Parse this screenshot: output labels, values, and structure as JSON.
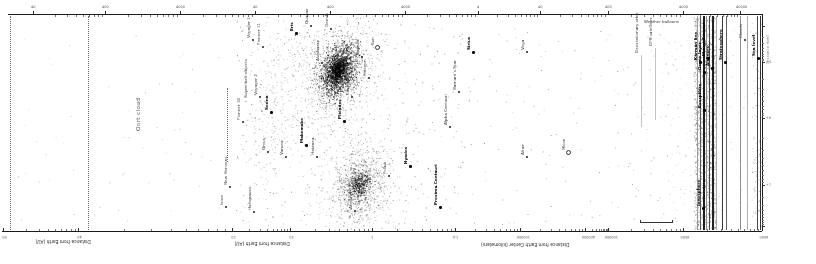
{
  "figure": {
    "background": "#ffffff",
    "ink": "#1a1a1a",
    "top_axis": {
      "y": 14,
      "x1": 8,
      "x2": 762,
      "majors": [
        {
          "x": 33,
          "t": "40"
        },
        {
          "x": 105,
          "t": "400"
        },
        {
          "x": 180,
          "t": "4000"
        },
        {
          "x": 255,
          "t": "40"
        },
        {
          "x": 330,
          "t": "400"
        },
        {
          "x": 405,
          "t": "4000"
        },
        {
          "x": 478,
          "t": "4"
        },
        {
          "x": 540,
          "t": "40"
        },
        {
          "x": 608,
          "t": "400"
        },
        {
          "x": 683,
          "t": "4000"
        },
        {
          "x": 740,
          "t": "40000"
        }
      ]
    },
    "bottom_axis": {
      "y": 231,
      "x1": 2,
      "x2": 762,
      "majors": [
        {
          "x": 3,
          "t": "80"
        },
        {
          "x": 78,
          "t": "40"
        },
        {
          "x": 232,
          "t": "20"
        },
        {
          "x": 290,
          "t": "10"
        },
        {
          "x": 372,
          "t": "1"
        },
        {
          "x": 455,
          "t": "1.6"
        },
        {
          "x": 520,
          "t": "100000"
        },
        {
          "x": 585,
          "t": "400000"
        },
        {
          "x": 608,
          "t": "100000"
        },
        {
          "x": 683,
          "t": "6500"
        },
        {
          "x": 762,
          "t": "6000"
        }
      ],
      "titles": [
        {
          "x": 62,
          "y": 237,
          "text": "Distance from Earth (AU)"
        },
        {
          "x": 261,
          "y": 239,
          "text": "Distance from Earth (AU)"
        },
        {
          "x": 525,
          "y": 240,
          "text": "Distance from Earth Center (kilometers)"
        }
      ]
    },
    "right_axis": {
      "x": 762,
      "y1": 14,
      "y2": 231,
      "majors": [
        26,
        62,
        118,
        185,
        226
      ],
      "labels": [
        {
          "y": 62,
          "t": "+5"
        },
        {
          "y": 118,
          "t": "+6"
        },
        {
          "y": 185,
          "t": "+7"
        }
      ]
    },
    "region_label": {
      "text": "Oort cloud"
    },
    "dotted_lines": [
      {
        "x": 10,
        "y1": 16,
        "y2": 230
      },
      {
        "x": 88,
        "y1": 16,
        "y2": 230
      },
      {
        "x": 227,
        "y1": 88,
        "y2": 162
      }
    ],
    "solid_lines": [
      {
        "x": 697,
        "w": 0.7,
        "c": "#9a9a9a"
      },
      {
        "x": 700,
        "w": 1,
        "c": "#555555"
      },
      {
        "x": 703,
        "w": 1.6,
        "c": "#1d1d1d"
      },
      {
        "x": 706,
        "w": 0.7,
        "c": "#8a8a8a"
      },
      {
        "x": 709,
        "w": 1,
        "c": "#444444"
      },
      {
        "x": 712,
        "w": 1.6,
        "c": "#222222"
      },
      {
        "x": 716,
        "w": 0.7,
        "c": "#aaaaaa"
      },
      {
        "x": 722,
        "w": 1,
        "c": "#3a3a3a"
      },
      {
        "x": 726,
        "w": 1,
        "c": "#606060"
      },
      {
        "x": 740,
        "w": 0.7,
        "c": "#8f8f8f"
      },
      {
        "x": 747,
        "w": 0.6,
        "c": "#b0b0b0"
      },
      {
        "x": 757,
        "w": 1,
        "c": "#474747"
      },
      {
        "x": 760,
        "w": 1.1,
        "c": "#333333"
      }
    ],
    "bracket": {
      "x": 640,
      "y": 220,
      "w": 33
    },
    "markers": [
      {
        "x": 253,
        "y": 40,
        "text": "Voyager 1"
      },
      {
        "x": 263,
        "y": 47,
        "text": "Pioneer 11"
      },
      {
        "x": 296,
        "y": 33,
        "text": "Eris",
        "bold": true
      },
      {
        "x": 311,
        "y": 26,
        "text": "Quaoar"
      },
      {
        "x": 260,
        "y": 97,
        "text": "Voyager 2"
      },
      {
        "x": 271,
        "y": 112,
        "text": "Sedna",
        "bold": true
      },
      {
        "x": 243,
        "y": 122,
        "text": "Pioneer 10"
      },
      {
        "x": 268,
        "y": 152,
        "text": "Orcus"
      },
      {
        "x": 286,
        "y": 157,
        "text": "Varuna"
      },
      {
        "x": 306,
        "y": 145,
        "text": "Makemake",
        "bold": true
      },
      {
        "x": 317,
        "y": 157,
        "text": "Haumea"
      },
      {
        "x": 230,
        "y": 187,
        "text": "New Horizons"
      },
      {
        "x": 254,
        "y": 212,
        "text": "Heliopause"
      },
      {
        "x": 226,
        "y": 207,
        "text": "Ixion"
      },
      {
        "x": 250,
        "y": 100,
        "text": "Kuiper belt objects",
        "type": "none"
      },
      {
        "x": 322,
        "y": 63,
        "text": "Aldebaran"
      },
      {
        "x": 362,
        "y": 57,
        "text": "Capella"
      },
      {
        "x": 377,
        "y": 47,
        "text": "Sun",
        "type": "circle"
      },
      {
        "x": 369,
        "y": 78,
        "text": "Procyon"
      },
      {
        "x": 352,
        "y": 97,
        "text": "Castor"
      },
      {
        "x": 344,
        "y": 121,
        "text": "Pleiades",
        "bold": true
      },
      {
        "x": 331,
        "y": 29,
        "text": "Deneb"
      },
      {
        "x": 410,
        "y": 166,
        "text": "Hyades",
        "bold": true
      },
      {
        "x": 389,
        "y": 176,
        "text": "Pollux"
      },
      {
        "x": 355,
        "y": 211,
        "text": "Arcturus"
      },
      {
        "x": 473,
        "y": 52,
        "text": "Sirius",
        "bold": true
      },
      {
        "x": 527,
        "y": 52,
        "text": "Vega"
      },
      {
        "x": 459,
        "y": 92,
        "text": "Barnard's Star"
      },
      {
        "x": 450,
        "y": 127,
        "text": "Alpha Centauri"
      },
      {
        "x": 527,
        "y": 157,
        "text": "Altair"
      },
      {
        "x": 440,
        "y": 207,
        "text": "Proxima Centauri",
        "bold": true
      },
      {
        "x": 568,
        "y": 152,
        "text": "Moon",
        "type": "circle"
      },
      {
        "x": 641,
        "y": 55,
        "text": "Geostationary orbit",
        "type": "line"
      },
      {
        "x": 655,
        "y": 48,
        "text": "GPS satellites",
        "type": "line"
      },
      {
        "x": 678,
        "y": 23,
        "text": "Weather balloons",
        "orient": "h",
        "type": "none"
      },
      {
        "x": 700,
        "y": 62,
        "text": "Kármán line",
        "bold": true
      },
      {
        "x": 704,
        "y": 72,
        "text": "Ozone layer",
        "bold": true
      },
      {
        "x": 708,
        "y": 58,
        "text": "Mount Everest",
        "bold": true
      },
      {
        "x": 712,
        "y": 68,
        "text": "Airliners",
        "bold": true
      },
      {
        "x": 704,
        "y": 110,
        "text": "Exosphere",
        "bold": true
      },
      {
        "x": 703,
        "y": 208,
        "text": "Ionosphere",
        "bold": true
      },
      {
        "x": 725,
        "y": 62,
        "text": "Stratosphere",
        "bold": true
      },
      {
        "x": 745,
        "y": 40,
        "text": "Clouds"
      },
      {
        "x": 758,
        "y": 58,
        "text": "Sea level",
        "bold": true
      },
      {
        "x": 772,
        "y": 66,
        "text": "Distance (km)",
        "type": "none",
        "muted": true
      }
    ],
    "clouds": [
      {
        "cx": 338,
        "cy": 70,
        "sx": 4,
        "sy": 7,
        "ang": 20,
        "n": 500,
        "a": 0.9,
        "s": 1
      },
      {
        "cx": 338,
        "cy": 70,
        "sx": 8,
        "sy": 13,
        "ang": 20,
        "n": 1500,
        "a": 0.75,
        "s": 2
      },
      {
        "cx": 337,
        "cy": 72,
        "sx": 17,
        "sy": 24,
        "ang": 20,
        "n": 750,
        "a": 0.45,
        "s": 3
      },
      {
        "cx": 336,
        "cy": 74,
        "sx": 28,
        "sy": 36,
        "ang": 18,
        "n": 380,
        "a": 0.3,
        "s": 4
      },
      {
        "cx": 359,
        "cy": 185,
        "sx": 5,
        "sy": 7,
        "ang": 15,
        "n": 380,
        "a": 0.7,
        "s": 5
      },
      {
        "cx": 359,
        "cy": 185,
        "sx": 13,
        "sy": 20,
        "ang": 12,
        "n": 750,
        "a": 0.45,
        "s": 6
      },
      {
        "cx": 360,
        "cy": 186,
        "sx": 23,
        "sy": 33,
        "ang": 10,
        "n": 330,
        "a": 0.3,
        "s": 7
      },
      {
        "cx": 272,
        "cy": 115,
        "sx": 13,
        "sy": 55,
        "ang": 8,
        "n": 240,
        "a": 0.3,
        "s": 8
      },
      {
        "cx": 700,
        "cy": 120,
        "sx": 26,
        "sy": 70,
        "ang": 0,
        "n": 200,
        "a": 0.2,
        "s": 9
      }
    ],
    "noise": [
      {
        "x": 236,
        "y": 20,
        "w": 238,
        "h": 206,
        "n": 380,
        "a": 0.5,
        "s": 11
      },
      {
        "x": 476,
        "y": 28,
        "w": 148,
        "h": 196,
        "n": 85,
        "a": 0.45,
        "s": 12
      },
      {
        "x": 626,
        "y": 28,
        "w": 66,
        "h": 196,
        "n": 55,
        "a": 0.4,
        "s": 13
      },
      {
        "x": 694,
        "y": 17,
        "w": 22,
        "h": 212,
        "n": 1400,
        "a": 0.42,
        "s": 14
      },
      {
        "x": 751,
        "y": 17,
        "w": 10,
        "h": 212,
        "n": 120,
        "a": 0.4,
        "s": 15
      },
      {
        "x": 90,
        "y": 28,
        "w": 138,
        "h": 196,
        "n": 40,
        "a": 0.35,
        "s": 16
      },
      {
        "x": 13,
        "y": 28,
        "w": 73,
        "h": 196,
        "n": 20,
        "a": 0.3,
        "s": 17
      },
      {
        "x": 764,
        "y": 20,
        "w": 34,
        "h": 208,
        "n": 30,
        "a": 0.25,
        "s": 18
      }
    ]
  },
  "chart_data": {
    "type": "scatter",
    "title": "",
    "axes": [
      {
        "label": "Distance from Earth (AU)",
        "scale": "log",
        "tick_labels": [
          "80",
          "40"
        ]
      },
      {
        "label": "Distance from Earth (AU)",
        "scale": "log",
        "tick_labels": [
          "20",
          "10",
          "1"
        ]
      },
      {
        "label": "Distance from Earth Center (kilometers)",
        "scale": "log",
        "tick_labels": [
          "1.6",
          "100000",
          "400000"
        ]
      },
      {
        "label": "kilometers (near-Earth)",
        "scale": "log",
        "tick_labels": [
          "100000",
          "6500",
          "6000"
        ]
      }
    ],
    "regions": [
      {
        "name": "Oort cloud"
      }
    ],
    "clusters": [
      {
        "name": "dense star cluster (upper)",
        "center_px": [
          337,
          72
        ]
      },
      {
        "name": "dense star cluster (lower)",
        "center_px": [
          359,
          185
        ]
      }
    ],
    "points": [
      "Voyager 1",
      "Pioneer 11",
      "Eris",
      "Quaoar",
      "Voyager 2",
      "Sedna",
      "Pioneer 10",
      "Orcus",
      "Varuna",
      "Makemake",
      "Haumea",
      "New Horizons",
      "Heliopause",
      "Ixion",
      "Kuiper belt objects",
      "Aldebaran",
      "Capella",
      "Sun",
      "Procyon",
      "Castor",
      "Pleiades",
      "Deneb",
      "Hyades",
      "Pollux",
      "Arcturus",
      "Sirius",
      "Vega",
      "Barnard's Star",
      "Alpha Centauri",
      "Altair",
      "Proxima Centauri",
      "Moon",
      "Geostationary orbit",
      "GPS satellites",
      "Weather balloons",
      "Kármán line",
      "Ozone layer",
      "Mount Everest",
      "Airliners",
      "Exosphere",
      "Ionosphere",
      "Stratosphere",
      "Clouds",
      "Sea level"
    ]
  }
}
